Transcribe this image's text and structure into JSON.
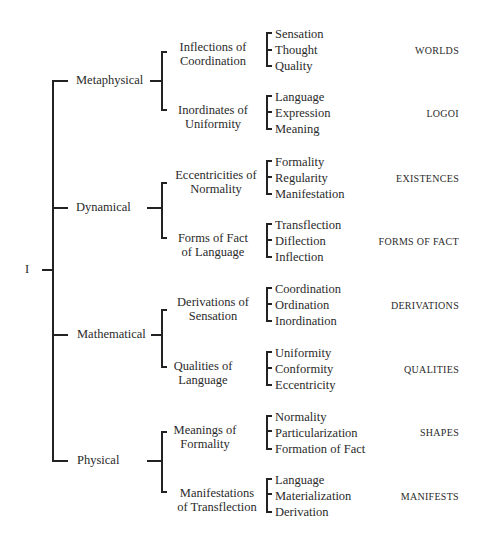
{
  "root": {
    "label": "I"
  },
  "branches": [
    {
      "label": "Metaphysical",
      "children": [
        {
          "label_lines": [
            "Inflections of",
            "Coordination"
          ],
          "items": [
            "Sensation",
            "Thought",
            "Quality"
          ],
          "category": "WORLDS"
        },
        {
          "label_lines": [
            "Inordinates of",
            "Uniformity"
          ],
          "items": [
            "Language",
            "Expression",
            "Meaning"
          ],
          "category": "LOGOI"
        }
      ]
    },
    {
      "label": "Dynamical",
      "children": [
        {
          "label_lines": [
            "Eccentricities of",
            "Normality"
          ],
          "items": [
            "Formality",
            "Regularity",
            "Manifestation"
          ],
          "category": "EXISTENCES"
        },
        {
          "label_lines": [
            "Forms of Fact",
            "of Language"
          ],
          "items": [
            "Transflection",
            "Diflection",
            "Inflection"
          ],
          "category": "FORMS OF FACT"
        }
      ]
    },
    {
      "label": "Mathematical",
      "children": [
        {
          "label_lines": [
            "Derivations of",
            "Sensation"
          ],
          "items": [
            "Coordination",
            "Ordination",
            "Inordination"
          ],
          "category": "DERIVATIONS"
        },
        {
          "label_lines": [
            "Qualities of",
            "Language"
          ],
          "items": [
            "Uniformity",
            "Conformity",
            "Eccentricity"
          ],
          "category": "QUALITIES"
        }
      ]
    },
    {
      "label": "Physical",
      "children": [
        {
          "label_lines": [
            "Meanings of",
            "Formality"
          ],
          "items": [
            "Normality",
            "Particularization",
            "Formation of Fact"
          ],
          "category": "SHAPES"
        },
        {
          "label_lines": [
            "Manifestations",
            "of Transflection"
          ],
          "items": [
            "Language",
            "Materialization",
            "Derivation"
          ],
          "category": "MANIFESTS"
        }
      ]
    }
  ]
}
